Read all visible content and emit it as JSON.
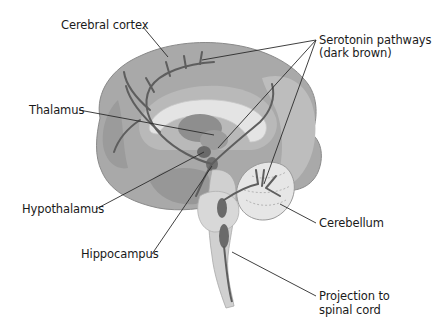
{
  "diagram": {
    "colors": {
      "background": "#ffffff",
      "cortex": "#a9a9a9",
      "cortex_dark": "#8f8f8f",
      "inner_light": "#d6d6d6",
      "corpus_callosum": "#e4e4e4",
      "pathway": "#5e5e5e",
      "nuclei": "#6f6f6f",
      "leader_line": "#2a2a2a",
      "text": "#1a1a1a"
    },
    "labels": {
      "cerebral_cortex": "Cerebral cortex",
      "thalamus": "Thalamus",
      "hypothalamus": "Hypothalamus",
      "hippocampus": "Hippocampus",
      "serotonin_line1": "Serotonin pathways",
      "serotonin_line2": "(dark brown)",
      "cerebellum": "Cerebellum",
      "projection_line1": "Projection to",
      "projection_line2": "spinal cord"
    }
  }
}
